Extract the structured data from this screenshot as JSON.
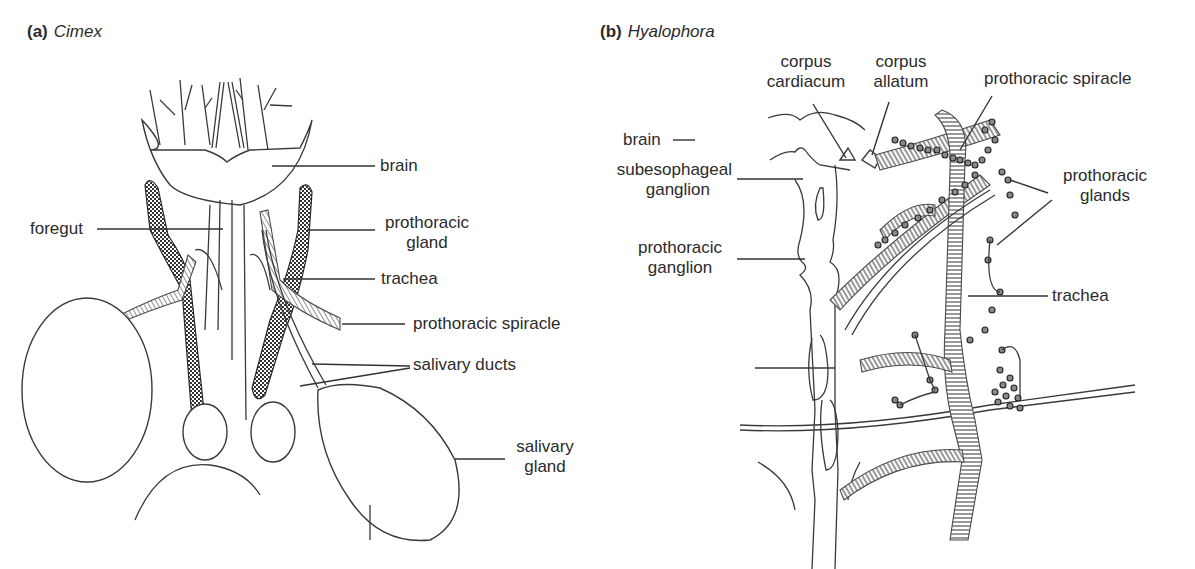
{
  "figure": {
    "panels": [
      {
        "letter": "(a)",
        "genus": "Cimex",
        "labels": {
          "brain": "brain",
          "foregut": "foregut",
          "prothoracic_gland_1": "prothoracic",
          "prothoracic_gland_2": "gland",
          "trachea": "trachea",
          "prothoracic_spiracle": "prothoracic spiracle",
          "salivary_ducts": "salivary ducts",
          "salivary_gland_1": "salivary",
          "salivary_gland_2": "gland"
        }
      },
      {
        "letter": "(b)",
        "genus": "Hyalophora",
        "labels": {
          "corpus_cardiacum_1": "corpus",
          "corpus_cardiacum_2": "cardiacum",
          "corpus_allatum_1": "corpus",
          "corpus_allatum_2": "allatum",
          "prothoracic_spiracle": "prothoracic spiracle",
          "brain": "brain",
          "subesophageal_ganglion_1": "subesophageal",
          "subesophageal_ganglion_2": "ganglion",
          "prothoracic_glands_1": "prothoracic",
          "prothoracic_glands_2": "glands",
          "prothoracic_ganglion_1": "prothoracic",
          "prothoracic_ganglion_2": "ganglion",
          "trachea": "trachea"
        }
      }
    ],
    "colors": {
      "ink": "#2b2b2b",
      "background": "#ffffff",
      "gland_fill": "#555555"
    }
  }
}
